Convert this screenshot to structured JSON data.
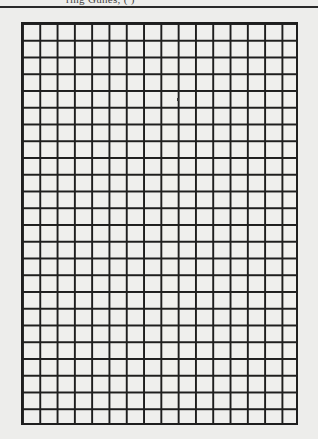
{
  "page": {
    "header_text": "ring Gunes, ( )",
    "background_color": "#ededeb",
    "line_color": "#1e1e1e"
  },
  "grid": {
    "columns": 16,
    "rows": 24,
    "cell_width_px": 17.3,
    "cell_height_px": 16.75
  }
}
